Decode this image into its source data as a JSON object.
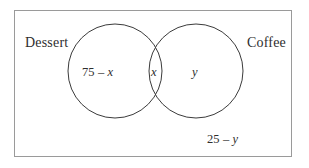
{
  "diagram": {
    "type": "venn-two-set",
    "title": "",
    "universe": {
      "name": "universe-rectangle",
      "border_color": "#9a9a9a"
    },
    "circle_color": "#3b3b3b",
    "text_color": "#2e2e2e",
    "background": "#ffffff",
    "sets": [
      {
        "id": "dessert",
        "label": "Dessert",
        "position": "top-left"
      },
      {
        "id": "coffee",
        "label": "Coffee",
        "position": "top-right"
      }
    ],
    "regions": [
      {
        "id": "left-only",
        "label": "75 – x",
        "number": "75 – ",
        "variable": "x",
        "meaning": "dessert-only"
      },
      {
        "id": "intersection",
        "label": "x",
        "number": "",
        "variable": "x",
        "meaning": "dessert-and-coffee"
      },
      {
        "id": "right-only",
        "label": "y",
        "number": "",
        "variable": "y",
        "meaning": "coffee-only"
      },
      {
        "id": "outside",
        "label": "25 – y",
        "number": "25 – ",
        "variable": "y",
        "meaning": "neither"
      }
    ]
  }
}
